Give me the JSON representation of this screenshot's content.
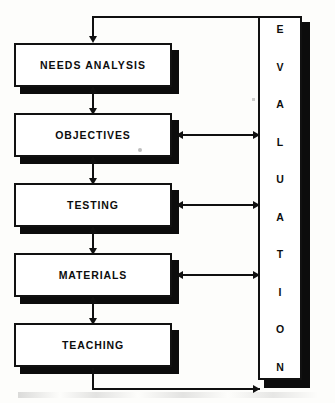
{
  "figure": {
    "type": "flowchart",
    "orientation": "vertical-with-side-column",
    "ink_color": "#101010",
    "background_color": "#fdfdfb"
  },
  "process_boxes": [
    {
      "id": "needs-analysis",
      "label": "NEEDS  ANALYSIS"
    },
    {
      "id": "objectives",
      "label": "OBJECTIVES"
    },
    {
      "id": "testing",
      "label": "TESTING"
    },
    {
      "id": "materials",
      "label": "MATERIALS"
    },
    {
      "id": "teaching",
      "label": "TEACHING"
    }
  ],
  "evaluation_column": {
    "label": "EVALUATION",
    "letters": [
      "E",
      "V",
      "A",
      "L",
      "U",
      "A",
      "T",
      "I",
      "O",
      "N"
    ]
  },
  "connectors": {
    "vertical_between_boxes": "double-headed",
    "to_evaluation": "double-headed",
    "top_feedback_loop": "evaluation-to-needs-analysis",
    "bottom_feedback_loop": "teaching-to-evaluation"
  }
}
